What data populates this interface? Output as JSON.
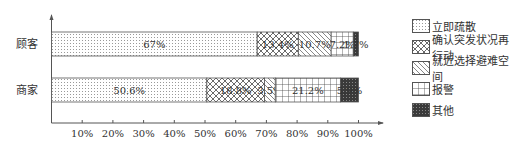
{
  "chart_data": {
    "type": "bar",
    "orientation": "horizontal",
    "stacked": true,
    "title": "",
    "xlabel": "",
    "ylabel": "",
    "xlim": [
      0,
      100
    ],
    "x_ticks": [
      "10%",
      "20%",
      "30%",
      "40%",
      "50%",
      "60%",
      "70%",
      "80%",
      "90%",
      "100%"
    ],
    "categories": [
      "顾客",
      "商家"
    ],
    "series": [
      {
        "name": "立即疏散",
        "pattern": "dots",
        "values": [
          67,
          50.6
        ],
        "labels": [
          "67%",
          "50.6%"
        ]
      },
      {
        "name": "确认突发状况再行动",
        "pattern": "crosshatch",
        "values": [
          13.4,
          18.8
        ],
        "labels": [
          "13.4%",
          "18.8%"
        ]
      },
      {
        "name": "就近选择避难空间",
        "pattern": "diagonal",
        "values": [
          10.7,
          3.5
        ],
        "labels": [
          "10.7%",
          "3.5%"
        ]
      },
      {
        "name": "报警",
        "pattern": "grid",
        "values": [
          7.2,
          21.2
        ],
        "labels": [
          "7.2%",
          "21.2%"
        ]
      },
      {
        "name": "其他",
        "pattern": "dark",
        "values": [
          1.7,
          5.9
        ],
        "labels": [
          "1.7%",
          "5.9%"
        ]
      }
    ],
    "legend_position": "right",
    "grid": false
  },
  "colors": {
    "stroke": "#555555",
    "text": "#333333",
    "dark_fill": "#3a3a3a"
  }
}
